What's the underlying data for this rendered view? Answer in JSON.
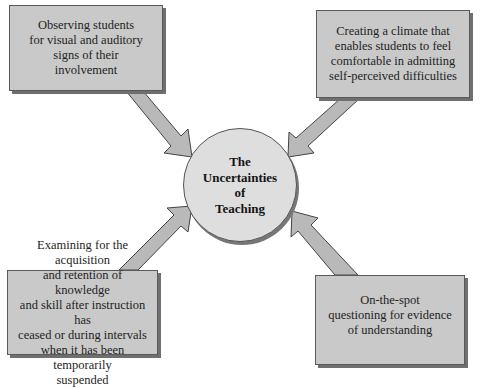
{
  "diagram": {
    "type": "hub-and-spoke",
    "center": {
      "label": "The\nUncertainties\nof\nTeaching"
    },
    "nodes": [
      {
        "id": "top-left",
        "text": "Observing students\nfor visual and auditory\nsigns of their\ninvolvement",
        "arrow_direction": "toward-center"
      },
      {
        "id": "top-right",
        "text": "Creating a climate that\nenables students to feel\ncomfortable in admitting\nself-perceived difficulties",
        "arrow_direction": "toward-center"
      },
      {
        "id": "bottom-left",
        "text": "Examining for the acquisition\nand retention of knowledge\nand skill after instruction has\nceased or during intervals\nwhen it has been temporarily\nsuspended",
        "arrow_direction": "toward-center"
      },
      {
        "id": "bottom-right",
        "text": "On-the-spot\nquestioning for evidence\nof understanding",
        "arrow_direction": "toward-center"
      }
    ],
    "colors": {
      "box_fill": "#c9c9c9",
      "box_border": "#5a5a5a",
      "box_shadow": "#6f6f6f",
      "circle_fill": "#dedede",
      "arrow_fill": "#b9b9b9",
      "arrow_stroke": "#444444",
      "text": "#1e1e1e"
    }
  }
}
